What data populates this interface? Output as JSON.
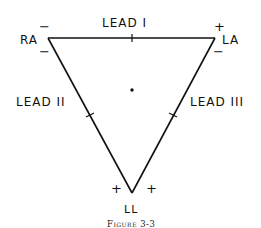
{
  "figure": {
    "caption": "Figure 3-3",
    "vertices": {
      "ra": {
        "label": "RA",
        "signs": [
          "−",
          "−"
        ]
      },
      "la": {
        "label": "LA",
        "signs": [
          "+",
          "−"
        ]
      },
      "ll": {
        "label": "LL",
        "signs": [
          "+",
          "+"
        ]
      }
    },
    "leads": [
      {
        "label": "LEAD I"
      },
      {
        "label": "LEAD II"
      },
      {
        "label": "LEAD III"
      }
    ],
    "stroke_color": "#111111",
    "background": "#ffffff"
  }
}
